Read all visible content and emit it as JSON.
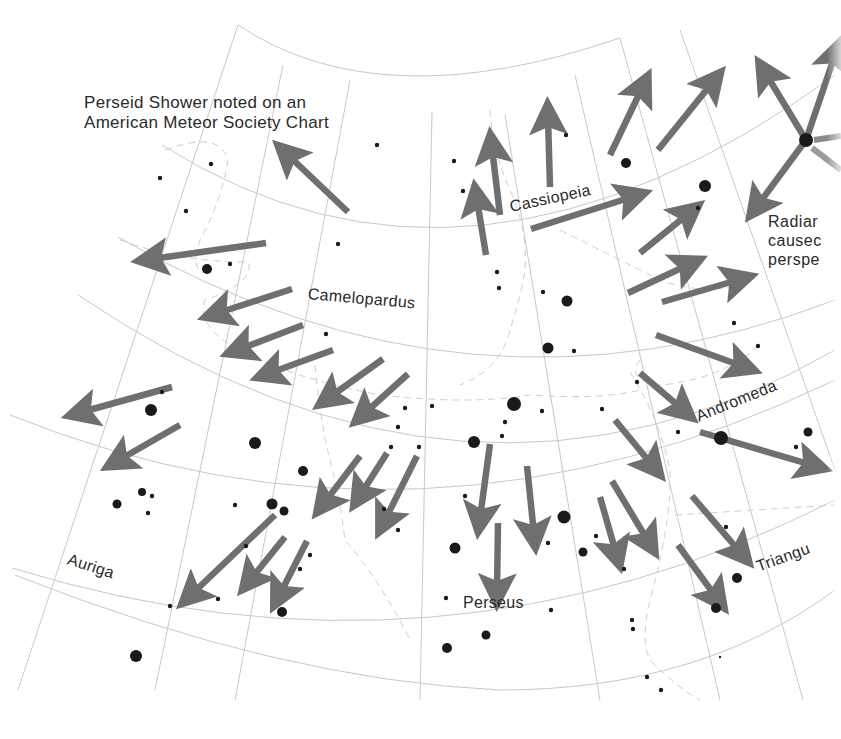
{
  "title": {
    "line1": "Perseid Shower noted on an",
    "line2": "American Meteor Society Chart"
  },
  "caption": {
    "line1": "Radiar",
    "line2": "causec",
    "line3": "perspe"
  },
  "constellations": [
    {
      "name": "Cassiopeia",
      "x": 512,
      "y": 210,
      "rotate": -12
    },
    {
      "name": "Camelopardus",
      "x": 309,
      "y": 296,
      "rotate": 5
    },
    {
      "name": "Andromeda",
      "x": 697,
      "y": 410,
      "rotate": -22
    },
    {
      "name": "Auriga",
      "x": 68,
      "y": 560,
      "rotate": 18
    },
    {
      "name": "Perseus",
      "x": 463,
      "y": 603,
      "rotate": 0
    },
    {
      "name": "Triangu",
      "x": 757,
      "y": 560,
      "rotate": -20
    }
  ],
  "colors": {
    "arrow": "#6f6f6f",
    "grid": "#c8c8c8",
    "boundary": "#c8c8c8",
    "star": "#1a1a1a",
    "text": "#2a2a2a"
  },
  "arrows": [
    [
      348,
      212,
      288,
      155
    ],
    [
      266,
      243,
      152,
      259
    ],
    [
      292,
      289,
      218,
      313
    ],
    [
      303,
      325,
      240,
      349
    ],
    [
      333,
      350,
      270,
      373
    ],
    [
      383,
      359,
      330,
      397
    ],
    [
      408,
      374,
      365,
      413
    ],
    [
      172,
      387,
      82,
      412
    ],
    [
      180,
      425,
      119,
      460
    ],
    [
      550,
      187,
      548,
      118
    ],
    [
      500,
      215,
      492,
      148
    ],
    [
      486,
      255,
      477,
      200
    ],
    [
      610,
      155,
      642,
      88
    ],
    [
      658,
      150,
      712,
      83
    ],
    [
      531,
      229,
      632,
      197
    ],
    [
      640,
      253,
      688,
      214
    ],
    [
      628,
      293,
      688,
      265
    ],
    [
      662,
      302,
      738,
      280
    ],
    [
      656,
      335,
      742,
      366
    ],
    [
      640,
      373,
      682,
      409
    ],
    [
      700,
      432,
      812,
      465
    ],
    [
      615,
      420,
      652,
      465
    ],
    [
      490,
      444,
      480,
      518
    ],
    [
      527,
      466,
      534,
      534
    ],
    [
      360,
      456,
      325,
      502
    ],
    [
      387,
      453,
      361,
      494
    ],
    [
      417,
      456,
      385,
      520
    ],
    [
      498,
      523,
      497,
      590
    ],
    [
      600,
      497,
      616,
      553
    ],
    [
      612,
      481,
      648,
      541
    ],
    [
      692,
      496,
      740,
      552
    ],
    [
      678,
      545,
      716,
      597
    ],
    [
      275,
      515,
      192,
      594
    ],
    [
      285,
      537,
      251,
      579
    ],
    [
      307,
      541,
      280,
      594
    ],
    [
      806,
      140,
      766,
      74
    ],
    [
      806,
      140,
      758,
      205
    ],
    [
      806,
      140,
      835,
      55
    ]
  ],
  "stars": [
    [
      377,
      145,
      2.2
    ],
    [
      211,
      164,
      2.2
    ],
    [
      160,
      178,
      2.2
    ],
    [
      186,
      211,
      2.2
    ],
    [
      338,
      244,
      2.2
    ],
    [
      207,
      269,
      5
    ],
    [
      230,
      264,
      2.2
    ],
    [
      326,
      334,
      2.2
    ],
    [
      454,
      161,
      2.2
    ],
    [
      463,
      191,
      2.2
    ],
    [
      566,
      135,
      2.2
    ],
    [
      626,
      163,
      5
    ],
    [
      705,
      186,
      6
    ],
    [
      698,
      208,
      2.2
    ],
    [
      497,
      272,
      2.2
    ],
    [
      499,
      288,
      2.2
    ],
    [
      543,
      292,
      2.2
    ],
    [
      567,
      301,
      5.5
    ],
    [
      734,
      323,
      2.2
    ],
    [
      758,
      346,
      2.2
    ],
    [
      548,
      348,
      5.5
    ],
    [
      574,
      351,
      2.2
    ],
    [
      162,
      392,
      2.2
    ],
    [
      151,
      410,
      6
    ],
    [
      255,
      443,
      6
    ],
    [
      303,
      471,
      5
    ],
    [
      432,
      406,
      2.2
    ],
    [
      514,
      404,
      7
    ],
    [
      542,
      411,
      2.2
    ],
    [
      602,
      409,
      2.2
    ],
    [
      637,
      382,
      2.2
    ],
    [
      678,
      432,
      2.2
    ],
    [
      721,
      438,
      7
    ],
    [
      808,
      432,
      4.5
    ],
    [
      796,
      447,
      2.2
    ],
    [
      117,
      504,
      4.5
    ],
    [
      142,
      492,
      4
    ],
    [
      152,
      496,
      2.2
    ],
    [
      148,
      513,
      2.2
    ],
    [
      235,
      505,
      2.2
    ],
    [
      272,
      504,
      5.5
    ],
    [
      284,
      511,
      4.5
    ],
    [
      474,
      442,
      6
    ],
    [
      502,
      436,
      2.2
    ],
    [
      505,
      422,
      2.2
    ],
    [
      405,
      408,
      2.2
    ],
    [
      398,
      427,
      2.2
    ],
    [
      391,
      447,
      2.2
    ],
    [
      419,
      447,
      2.2
    ],
    [
      465,
      496,
      2.2
    ],
    [
      384,
      509,
      2.2
    ],
    [
      398,
      530,
      2.2
    ],
    [
      564,
      517,
      6.5
    ],
    [
      583,
      552,
      4.5
    ],
    [
      596,
      536,
      2.2
    ],
    [
      624,
      569,
      2.2
    ],
    [
      726,
      527,
      2.2
    ],
    [
      737,
      578,
      5
    ],
    [
      716,
      608,
      5
    ],
    [
      455,
      548,
      5.5
    ],
    [
      548,
      543,
      2.2
    ],
    [
      246,
      546,
      2.2
    ],
    [
      310,
      555,
      2.2
    ],
    [
      300,
      569,
      2.2
    ],
    [
      218,
      599,
      2.2
    ],
    [
      170,
      606,
      2.2
    ],
    [
      282,
      612,
      5
    ],
    [
      136,
      656,
      6
    ],
    [
      446,
      598,
      2.2
    ],
    [
      551,
      610,
      2.2
    ],
    [
      486,
      635,
      4.5
    ],
    [
      447,
      648,
      5
    ],
    [
      632,
      620,
      2.2
    ],
    [
      633,
      629,
      2.2
    ],
    [
      647,
      677,
      2.2
    ],
    [
      661,
      690,
      2.2
    ],
    [
      720,
      657,
      1.2
    ]
  ]
}
